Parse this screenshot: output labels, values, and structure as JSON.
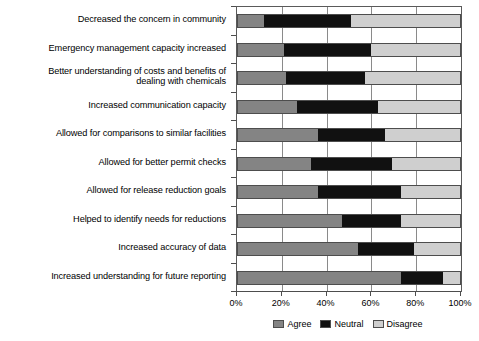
{
  "chart_data": {
    "type": "bar",
    "orientation": "horizontal",
    "stacked": true,
    "stack_mode": "percent",
    "title": "",
    "subtitle": "",
    "xlabel": "",
    "ylabel": "",
    "xlim": [
      0,
      100
    ],
    "xticks": [
      0,
      20,
      40,
      60,
      80,
      100
    ],
    "xtick_labels": [
      "0%",
      "20%",
      "40%",
      "60%",
      "80%",
      "100%"
    ],
    "grid": true,
    "grid_axis": "x",
    "legend_position": "bottom-center",
    "categories": [
      "Decreased the concern in community",
      "Emergency management capacity increased",
      "Better understanding of costs and benefits of dealing with chemicals",
      "Increased communication capacity",
      "Allowed for comparisons to similar facilities",
      "Allowed for better permit checks",
      "Allowed for release reduction goals",
      "Helped to identify needs for reductions",
      "Increased accuracy of data",
      "Increased understanding for future reporting"
    ],
    "series": [
      {
        "name": "Agree",
        "color": "#848484",
        "values": [
          12,
          21,
          22,
          27,
          36,
          33,
          36,
          47,
          54,
          73
        ]
      },
      {
        "name": "Neutral",
        "color": "#111111",
        "values": [
          39,
          39,
          35,
          36,
          30,
          36,
          37,
          26,
          25,
          19
        ]
      },
      {
        "name": "Disagree",
        "color": "#cfcfcf",
        "values": [
          49,
          40,
          43,
          37,
          34,
          31,
          27,
          27,
          21,
          8
        ]
      }
    ],
    "legend": [
      {
        "label": "Agree",
        "color": "#848484"
      },
      {
        "label": "Neutral",
        "color": "#111111"
      },
      {
        "label": "Disagree",
        "color": "#cfcfcf"
      }
    ]
  },
  "category_label_lines": [
    [
      "Decreased the concern in community"
    ],
    [
      "Emergency management capacity increased"
    ],
    [
      "Better understanding of costs and benefits of",
      "dealing with chemicals"
    ],
    [
      "Increased communication capacity"
    ],
    [
      "Allowed for comparisons to similar facilities"
    ],
    [
      "Allowed for better permit checks"
    ],
    [
      "Allowed for release reduction goals"
    ],
    [
      "Helped to identify needs for reductions"
    ],
    [
      "Increased accuracy of data"
    ],
    [
      "Increased understanding for future reporting"
    ]
  ]
}
